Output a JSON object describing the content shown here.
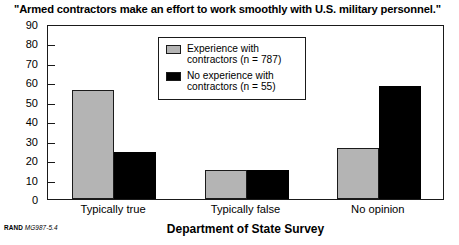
{
  "chart_data": {
    "type": "bar",
    "title": "\"Armed contractors make an effort to work smoothly with U.S. military personnel.\"",
    "xlabel": "Department of State Survey",
    "ylabel": "",
    "categories": [
      "Typically true",
      "Typically false",
      "No opinion"
    ],
    "series": [
      {
        "name": "Experience with contractors (n = 787)",
        "color": "#b4b4b4",
        "values": [
          56,
          15,
          26
        ]
      },
      {
        "name": "No experience with contractors (n = 55)",
        "color": "#000000",
        "values": [
          24,
          15,
          58
        ]
      }
    ],
    "ylim": [
      0,
      90
    ],
    "yticks": [
      0,
      10,
      20,
      30,
      40,
      50,
      60,
      70,
      80,
      90
    ],
    "ytick_labels": [
      "0",
      "10",
      "20",
      "30",
      "40",
      "50",
      "60",
      "70",
      "80",
      "90"
    ],
    "grid": false,
    "legend_position": "upper center",
    "legend_entries": [
      {
        "label_line1": "Experience with",
        "label_line2": "contractors (n = 787)",
        "swatch": "gray"
      },
      {
        "label_line1": "No experience with",
        "label_line2": "contractors (n = 55)",
        "swatch": "black"
      }
    ]
  },
  "footer": {
    "rand_mark": "RAND",
    "figure_number": "MG987-5.4"
  }
}
